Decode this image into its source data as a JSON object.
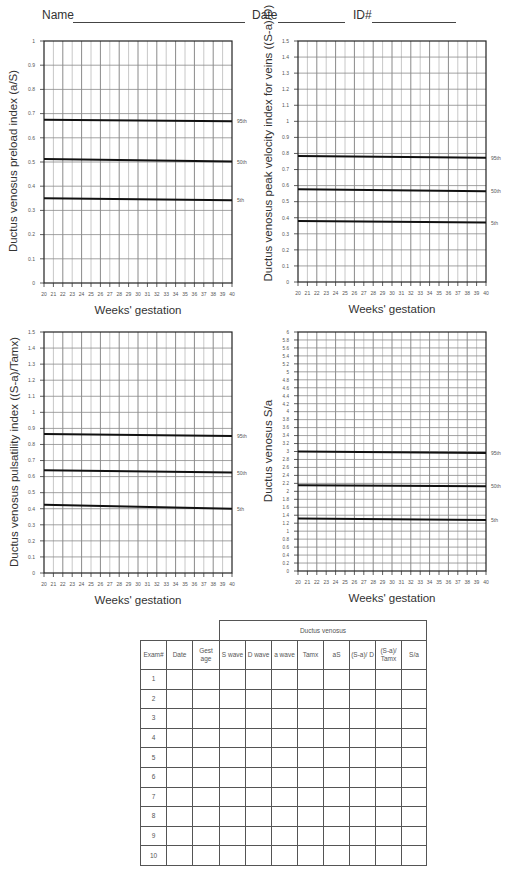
{
  "header": {
    "name_label": "Name",
    "date_label": "Date",
    "id_label": "ID#"
  },
  "chart_data": [
    {
      "type": "line",
      "title": "",
      "xlabel": "Weeks' gestation",
      "ylabel": "Ductus venosus preload index (a/S)",
      "x": [
        20,
        40
      ],
      "xticks": [
        "20",
        "21",
        "22",
        "23",
        "24",
        "25",
        "26",
        "27",
        "28",
        "29",
        "30",
        "31",
        "32",
        "33",
        "34",
        "35",
        "36",
        "37",
        "38",
        "39",
        "40"
      ],
      "yticks": [
        "0",
        "0.1",
        "0.2",
        "0.3",
        "0.4",
        "0.5",
        "0.6",
        "0.7",
        "0.8",
        "0.9",
        "1"
      ],
      "ylim": [
        0,
        1
      ],
      "grid": true,
      "series": [
        {
          "name": "95th",
          "values": [
            0.675,
            0.668
          ]
        },
        {
          "name": "50th",
          "values": [
            0.512,
            0.502
          ]
        },
        {
          "name": "5th",
          "values": [
            0.35,
            0.342
          ]
        }
      ]
    },
    {
      "type": "line",
      "title": "",
      "xlabel": "Weeks' gestation",
      "ylabel": "Ductus venosus peak velocity index for veins ((S-a)/D)",
      "x": [
        20,
        40
      ],
      "xticks": [
        "20",
        "21",
        "22",
        "23",
        "24",
        "25",
        "26",
        "27",
        "28",
        "29",
        "30",
        "31",
        "32",
        "33",
        "34",
        "35",
        "36",
        "37",
        "38",
        "39",
        "40"
      ],
      "yticks": [
        "0",
        "0.1",
        "0.2",
        "0.3",
        "0.4",
        "0.5",
        "0.6",
        "0.7",
        "0.8",
        "0.9",
        "1",
        "1.1",
        "1.2",
        "1.3",
        "1.4",
        "1.5"
      ],
      "ylim": [
        0,
        1.5
      ],
      "grid": true,
      "series": [
        {
          "name": "95th",
          "values": [
            0.785,
            0.773
          ]
        },
        {
          "name": "50th",
          "values": [
            0.577,
            0.565
          ]
        },
        {
          "name": "5th",
          "values": [
            0.38,
            0.37
          ]
        }
      ]
    },
    {
      "type": "line",
      "title": "",
      "xlabel": "Weeks' gestation",
      "ylabel": "Ductus venosus pulsatility index ((S-a)/Tamx)",
      "x": [
        20,
        40
      ],
      "xticks": [
        "20",
        "21",
        "22",
        "23",
        "24",
        "25",
        "26",
        "27",
        "28",
        "29",
        "30",
        "31",
        "32",
        "33",
        "34",
        "35",
        "36",
        "37",
        "38",
        "39",
        "40"
      ],
      "yticks": [
        "0",
        "0.1",
        "0.2",
        "0.3",
        "0.4",
        "0.5",
        "0.6",
        "0.7",
        "0.8",
        "0.9",
        "1",
        "1.1",
        "1.2",
        "1.3",
        "1.4",
        "1.5"
      ],
      "ylim": [
        0,
        1.5
      ],
      "grid": true,
      "series": [
        {
          "name": "95th",
          "values": [
            0.865,
            0.852
          ]
        },
        {
          "name": "50th",
          "values": [
            0.64,
            0.625
          ]
        },
        {
          "name": "5th",
          "values": [
            0.425,
            0.4
          ]
        }
      ]
    },
    {
      "type": "line",
      "title": "",
      "xlabel": "Weeks' gestation",
      "ylabel": "Ductus venosus S/a",
      "x": [
        20,
        40
      ],
      "xticks": [
        "20",
        "21",
        "22",
        "23",
        "24",
        "25",
        "26",
        "27",
        "28",
        "29",
        "30",
        "31",
        "32",
        "33",
        "34",
        "35",
        "36",
        "37",
        "38",
        "39",
        "40"
      ],
      "yticks": [
        "0",
        "0.2",
        "0.4",
        "0.6",
        "0.8",
        "1",
        "1.2",
        "1.4",
        "1.6",
        "1.8",
        "2",
        "2.2",
        "2.4",
        "2.6",
        "2.8",
        "3",
        "3.2",
        "3.4",
        "3.6",
        "3.8",
        "4",
        "4.2",
        "4.4",
        "4.6",
        "4.8",
        "5",
        "5.2",
        "5.4",
        "5.6",
        "5.8",
        "6"
      ],
      "ylim": [
        0,
        6
      ],
      "grid": true,
      "series": [
        {
          "name": "95th",
          "values": [
            3.0,
            2.96
          ]
        },
        {
          "name": "50th",
          "values": [
            2.15,
            2.13
          ]
        },
        {
          "name": "5th",
          "values": [
            1.32,
            1.28
          ]
        }
      ]
    }
  ],
  "table": {
    "group_header": "Ductus venosus",
    "columns": [
      "Exam#",
      "Date",
      "Gest age",
      "S wave",
      "D wave",
      "a wave",
      "Tamx",
      "aS",
      "(S-a)/ D",
      "(S-a)/ Tamx",
      "S/a"
    ],
    "rows": [
      "1",
      "2",
      "3",
      "4",
      "5",
      "6",
      "7",
      "8",
      "9",
      "10"
    ]
  }
}
